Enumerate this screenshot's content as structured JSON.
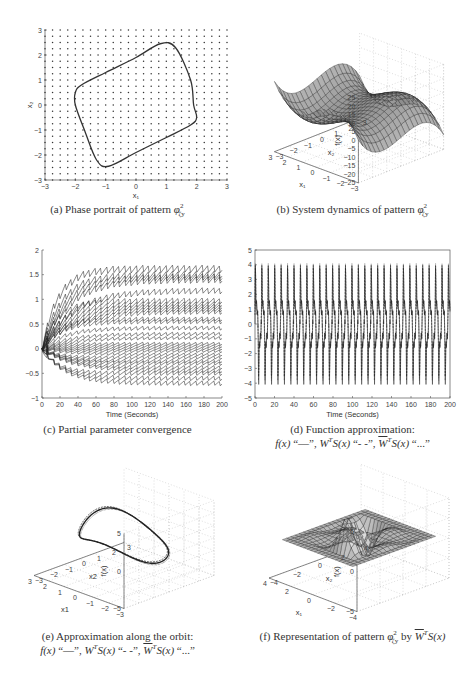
{
  "figure": {
    "captions": {
      "a": "(a) Phase portrait of pattern φ²ζy",
      "b": "(b) System dynamics of pattern φ²ζy",
      "c": "(c) Partial parameter convergence",
      "d_line1": "(d) Function approximation:",
      "d_line2": "f(x) \"—\", Ŵᵀ S(x) \"- -\", W̄ᵀ S(x) \"...\"",
      "e_line1": "(e) Approximation along the orbit:",
      "e_line2": "f(x) \"—\", Ŵᵀ S(x) \"- -\", W̄ᵀ S(x) \"...\"",
      "f": "(f) Representation of pattern φ²ζy by W̄ᵀ S(x)"
    },
    "caption_parts": {
      "a_prefix": "(a) Phase portrait of pattern ",
      "b_prefix": "(b) System dynamics of pattern ",
      "c_text": "(c) Partial parameter convergence",
      "d_prefix": "(d) Function approximation:",
      "e_prefix": "(e) Approximation along the orbit:",
      "f_prefix": "(f) Representation of pattern ",
      "f_by": " by ",
      "phi": "φ",
      "phi_sup": "2",
      "phi_sub": "ζy",
      "legend_fx": "f(x)",
      "legend_solid": " “—”, ",
      "legend_W": "W",
      "legend_T": "T",
      "legend_S": "S(x)",
      "legend_dashed": " “- -”, ",
      "legend_dotted": " “...”",
      "f_S": "S(x)"
    }
  },
  "chart_data": [
    {
      "id": "a",
      "type": "scatter",
      "title": "Phase portrait of pattern φ²ζy",
      "xlabel": "x1",
      "ylabel": "x2",
      "xlim": [
        -3,
        3
      ],
      "ylim": [
        -3,
        3
      ],
      "xticks": [
        "-3",
        "-2",
        "-1",
        "0",
        "1",
        "2",
        "3"
      ],
      "yticks": [
        "-3",
        "-2",
        "-1",
        "0",
        "1",
        "2",
        "3"
      ],
      "grid_points": "dot lattice spacing 0.25 over [-3,3]x[-3,3]",
      "orbit": {
        "x": [
          -2.0,
          -1.8,
          -1.0,
          0.0,
          0.8,
          1.3,
          1.8,
          1.9,
          2.0,
          1.8,
          1.0,
          0.0,
          -0.9,
          -1.3,
          -1.7,
          -2.0
        ],
        "y": [
          0.5,
          0.8,
          1.3,
          1.9,
          2.45,
          2.3,
          1.0,
          0.0,
          -0.5,
          -0.8,
          -1.3,
          -1.9,
          -2.45,
          -2.2,
          -1.0,
          0.0
        ]
      }
    },
    {
      "id": "b",
      "type": "surface",
      "title": "System dynamics of pattern φ²ζy",
      "xlabel": "x1",
      "ylabel": "x2",
      "zlabel": "f(x)",
      "xlim": [
        -3,
        3
      ],
      "ylim": [
        -3,
        3
      ],
      "zlim": [
        -25,
        25
      ],
      "xticks": [
        "-3",
        "-2",
        "-1",
        "0",
        "1",
        "2",
        "3"
      ],
      "yticks": [
        "-3",
        "-2",
        "-1",
        "0",
        "1",
        "2",
        "3"
      ],
      "zticks": [
        "-25",
        "-20",
        "-15",
        "-10",
        "-5",
        "0",
        "5",
        "10",
        "15",
        "20",
        "25"
      ],
      "corner_values": {
        "x1=-3": 22,
        "x2=3": -22
      }
    },
    {
      "id": "c",
      "type": "line",
      "title": "Partial parameter convergence",
      "xlabel": "Time (Seconds)",
      "ylabel": "",
      "xlim": [
        0,
        200
      ],
      "ylim": [
        -1,
        2
      ],
      "xticks": [
        "0",
        "20",
        "40",
        "60",
        "80",
        "100",
        "120",
        "140",
        "160",
        "180",
        "200"
      ],
      "yticks": [
        "-1",
        "-0.5",
        "0",
        "0.5",
        "1",
        "1.5",
        "2"
      ],
      "final_values": [
        1.62,
        1.5,
        1.45,
        1.4,
        1.18,
        0.97,
        0.9,
        0.85,
        0.8,
        0.75,
        0.6,
        0.55,
        0.42,
        0.3,
        0.22,
        0.1,
        0.05,
        0.0,
        -0.05,
        -0.12,
        -0.18,
        -0.25,
        -0.3,
        -0.38,
        -0.45,
        -0.5,
        -0.6,
        -0.7
      ]
    },
    {
      "id": "d",
      "type": "line",
      "title": "Function approximation",
      "xlabel": "Time (Seconds)",
      "ylabel": "",
      "xlim": [
        0,
        200
      ],
      "ylim": [
        -5,
        5
      ],
      "xticks": [
        "0",
        "20",
        "40",
        "60",
        "80",
        "100",
        "120",
        "140",
        "160",
        "180",
        "200"
      ],
      "yticks": [
        "-5",
        "-4",
        "-3",
        "-2",
        "-1",
        "0",
        "1",
        "2",
        "3",
        "4",
        "5"
      ],
      "series": [
        {
          "name": "f(x)",
          "style": "solid",
          "amplitude": 4.1,
          "period_s": 6.6
        },
        {
          "name": "Ŵᵀ S(x)",
          "style": "dashed",
          "amplitude": 4.1,
          "period_s": 6.6
        },
        {
          "name": "W̄ᵀ S(x)",
          "style": "dotted",
          "amplitude": 4.1,
          "period_s": 6.6
        }
      ],
      "plateaus": [
        1.6,
        0.6,
        -0.6,
        -1.6
      ]
    },
    {
      "id": "e",
      "type": "line3d",
      "title": "Approximation along the orbit",
      "xlabel": "x1",
      "ylabel": "x2",
      "zlabel": "f(x)",
      "xlim": [
        -3,
        3
      ],
      "ylim": [
        -3,
        3
      ],
      "zlim": [
        -5,
        5
      ],
      "xticks": [
        "-3",
        "-2",
        "-1",
        "0",
        "1",
        "2",
        "3"
      ],
      "yticks": [
        "-3",
        "-2",
        "-1",
        "0",
        "1",
        "2",
        "3"
      ],
      "zticks": [
        "-5",
        "0",
        "5"
      ]
    },
    {
      "id": "f",
      "type": "surface",
      "title": "Representation of pattern φ²ζy by W̄ᵀ S(x)",
      "xlabel": "x1",
      "ylabel": "x2",
      "zlabel": "f(x)",
      "xlim": [
        -4,
        4
      ],
      "ylim": [
        -4,
        4
      ],
      "zlim": [
        -5,
        5
      ],
      "xticks": [
        "-4",
        "-2",
        "0",
        "2",
        "4"
      ],
      "yticks": [
        "-4",
        "-2",
        "0",
        "2",
        "4"
      ],
      "zticks": [
        "-5",
        "0",
        "5"
      ]
    }
  ]
}
